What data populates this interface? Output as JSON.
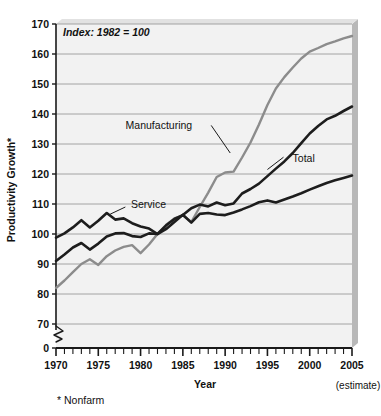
{
  "chart_data": {
    "type": "line",
    "title": "",
    "annotation": "Index: 1982 = 100",
    "xlabel": "Year",
    "ylabel": "Productivity Growth*",
    "footnote": "* Nonfarm",
    "estimate_note": "(estimate)",
    "grid": true,
    "legend_position": "inline-labels",
    "axis_break": true,
    "xlim": [
      1970,
      2005
    ],
    "ylim": [
      70,
      170
    ],
    "y_zero_tick": "0",
    "ytick_labels": [
      "70",
      "80",
      "90",
      "100",
      "110",
      "120",
      "130",
      "140",
      "150",
      "160",
      "170"
    ],
    "ytick_values": [
      70,
      80,
      90,
      100,
      110,
      120,
      130,
      140,
      150,
      160,
      170
    ],
    "xtick_labels": [
      "1970",
      "1975",
      "1980",
      "1985",
      "1990",
      "1995",
      "2000",
      "2005"
    ],
    "xtick_values": [
      1970,
      1975,
      1980,
      1985,
      1990,
      1995,
      2000,
      2005
    ],
    "x_minor_tick_interval": 1,
    "x": [
      1970,
      1971,
      1972,
      1973,
      1974,
      1975,
      1976,
      1977,
      1978,
      1979,
      1980,
      1981,
      1982,
      1983,
      1984,
      1985,
      1986,
      1987,
      1988,
      1989,
      1990,
      1991,
      1992,
      1993,
      1994,
      1995,
      1996,
      1997,
      1998,
      1999,
      2000,
      2001,
      2002,
      2003,
      2004,
      2005
    ],
    "series": [
      {
        "name": "Manufacturing",
        "color": "#8c8c8c",
        "width": 2.4,
        "label_x": 1986.1,
        "label_y": 136.2,
        "values": [
          82.0,
          84.5,
          87.3,
          90.0,
          91.6,
          89.7,
          92.6,
          94.5,
          95.7,
          96.3,
          93.6,
          96.5,
          100.0,
          103.0,
          105.2,
          106.2,
          104.0,
          109.0,
          113.8,
          119.0,
          120.5,
          120.8,
          125.5,
          130.5,
          136.5,
          143.0,
          148.5,
          152.3,
          155.5,
          158.5,
          160.8,
          162.0,
          163.3,
          164.2,
          165.2,
          166.0
        ]
      },
      {
        "name": "Total",
        "color": "#1d1d1d",
        "width": 2.6,
        "label_x": 1997.5,
        "label_y": 125.3,
        "values": [
          91.0,
          93.2,
          95.5,
          97.0,
          94.8,
          96.8,
          99.2,
          100.2,
          100.3,
          99.3,
          99.0,
          100.2,
          100.0,
          102.8,
          105.0,
          106.3,
          108.6,
          109.8,
          109.2,
          110.5,
          109.6,
          110.2,
          113.5,
          115.0,
          116.8,
          119.3,
          121.8,
          124.2,
          127.0,
          130.3,
          133.5,
          136.0,
          138.2,
          139.4,
          141.0,
          142.5
        ]
      },
      {
        "name": "Service",
        "color": "#1d1d1d",
        "width": 2.6,
        "label_x": 1978.4,
        "label_y": 109.7,
        "values": [
          98.8,
          100.2,
          102.2,
          104.6,
          102.2,
          104.4,
          107.0,
          104.8,
          105.2,
          103.6,
          102.5,
          101.8,
          100.0,
          101.6,
          104.0,
          106.4,
          103.8,
          106.7,
          107.0,
          106.5,
          106.3,
          107.2,
          108.2,
          109.3,
          110.6,
          111.2,
          110.5,
          111.5,
          112.5,
          113.6,
          114.8,
          115.9,
          117.0,
          117.9,
          118.7,
          119.5
        ]
      }
    ]
  },
  "leaders": {
    "manufacturing": {
      "x1": 1988.35,
      "y1": 136.2,
      "x2": 1990.6,
      "y2": 127.0
    },
    "total": {
      "x1": 1996.9,
      "y1": 125.6,
      "x2": 1995.0,
      "y2": 121.5
    },
    "service": {
      "x1": 1978.2,
      "y1": 109.0,
      "x2": 1976.4,
      "y2": 106.6
    }
  },
  "colors": {
    "plot_background": "#f2f2f2",
    "gridline": "#9a9a9a",
    "axis": "#1a1a1a",
    "bevel_light": "#e2e2e2",
    "bevel_dark": "#b8b8b8",
    "page_background": "#ffffff"
  }
}
